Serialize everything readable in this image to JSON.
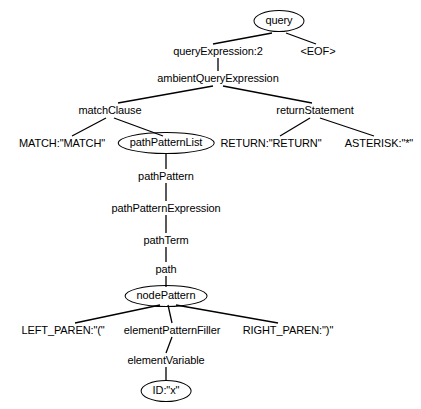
{
  "diagram": {
    "type": "parse-tree",
    "background_color": "#ffffff",
    "stroke_color": "#000000",
    "text_color": "#000000",
    "nodes": [
      {
        "id": "query",
        "label": "query",
        "shape": "ellipse",
        "x": 279,
        "y": 21,
        "depth": 0
      },
      {
        "id": "queryExpression",
        "label": "queryExpression:2",
        "shape": "plain",
        "x": 218,
        "y": 51,
        "depth": 1
      },
      {
        "id": "eof",
        "label": "<EOF>",
        "shape": "plain",
        "x": 318,
        "y": 51,
        "depth": 1
      },
      {
        "id": "ambientQueryExpression",
        "label": "ambientQueryExpression",
        "shape": "plain",
        "x": 218,
        "y": 78,
        "depth": 2
      },
      {
        "id": "matchClause",
        "label": "matchClause",
        "shape": "plain",
        "x": 110,
        "y": 110,
        "depth": 3
      },
      {
        "id": "returnStatement",
        "label": "returnStatement",
        "shape": "plain",
        "x": 315,
        "y": 110,
        "depth": 3
      },
      {
        "id": "matchToken",
        "label": "MATCH:\"MATCH\"",
        "shape": "plain",
        "x": 62,
        "y": 143,
        "depth": 4
      },
      {
        "id": "pathPatternList",
        "label": "pathPatternList",
        "shape": "ellipse",
        "x": 166,
        "y": 143,
        "depth": 4
      },
      {
        "id": "returnToken",
        "label": "RETURN:\"RETURN\"",
        "shape": "plain",
        "x": 271,
        "y": 143,
        "depth": 4
      },
      {
        "id": "asteriskToken",
        "label": "ASTERISK:\"*\"",
        "shape": "plain",
        "x": 379,
        "y": 143,
        "depth": 4
      },
      {
        "id": "pathPattern",
        "label": "pathPattern",
        "shape": "plain",
        "x": 166,
        "y": 176,
        "depth": 5
      },
      {
        "id": "pathPatternExpression",
        "label": "pathPatternExpression",
        "shape": "plain",
        "x": 166,
        "y": 208,
        "depth": 6
      },
      {
        "id": "pathTerm",
        "label": "pathTerm",
        "shape": "plain",
        "x": 166,
        "y": 240,
        "depth": 7
      },
      {
        "id": "path",
        "label": "path",
        "shape": "plain",
        "x": 166,
        "y": 269,
        "depth": 8
      },
      {
        "id": "nodePattern",
        "label": "nodePattern",
        "shape": "ellipse",
        "x": 166,
        "y": 296,
        "depth": 9
      },
      {
        "id": "leftParen",
        "label": "LEFT_PAREN:\"(\"",
        "shape": "plain",
        "x": 63,
        "y": 330,
        "depth": 10
      },
      {
        "id": "elementPatternFiller",
        "label": "elementPatternFiller",
        "shape": "plain",
        "x": 172,
        "y": 330,
        "depth": 10
      },
      {
        "id": "rightParen",
        "label": "RIGHT_PAREN:\")\"",
        "shape": "plain",
        "x": 288,
        "y": 330,
        "depth": 10
      },
      {
        "id": "elementVariable",
        "label": "elementVariable",
        "shape": "plain",
        "x": 166,
        "y": 360,
        "depth": 11
      },
      {
        "id": "idToken",
        "label": "ID:\"x\"",
        "shape": "ellipse",
        "x": 166,
        "y": 391,
        "depth": 12
      }
    ],
    "edges": [
      {
        "from": "query",
        "to": "queryExpression",
        "x1": 272,
        "y1": 33,
        "x2": 213,
        "y2": 44
      },
      {
        "from": "query",
        "to": "eof",
        "x1": 286,
        "y1": 33,
        "x2": 316,
        "y2": 44
      },
      {
        "from": "queryExpression",
        "to": "ambientQueryExpression",
        "x1": 218,
        "y1": 58,
        "x2": 218,
        "y2": 71
      },
      {
        "from": "ambientQueryExpression",
        "to": "matchClause",
        "x1": 213,
        "y1": 86,
        "x2": 118,
        "y2": 103
      },
      {
        "from": "ambientQueryExpression",
        "to": "returnStatement",
        "x1": 223,
        "y1": 86,
        "x2": 312,
        "y2": 103
      },
      {
        "from": "matchClause",
        "to": "matchToken",
        "x1": 106,
        "y1": 118,
        "x2": 72,
        "y2": 136
      },
      {
        "from": "matchClause",
        "to": "pathPatternList",
        "x1": 114,
        "y1": 118,
        "x2": 163,
        "y2": 136
      },
      {
        "from": "returnStatement",
        "to": "returnToken",
        "x1": 310,
        "y1": 118,
        "x2": 280,
        "y2": 136
      },
      {
        "from": "returnStatement",
        "to": "asteriskToken",
        "x1": 320,
        "y1": 118,
        "x2": 374,
        "y2": 136
      },
      {
        "from": "pathPatternList",
        "to": "pathPattern",
        "x1": 166,
        "y1": 154,
        "x2": 166,
        "y2": 169
      },
      {
        "from": "pathPattern",
        "to": "pathPatternExpression",
        "x1": 166,
        "y1": 183,
        "x2": 166,
        "y2": 201
      },
      {
        "from": "pathPatternExpression",
        "to": "pathTerm",
        "x1": 166,
        "y1": 215,
        "x2": 166,
        "y2": 233
      },
      {
        "from": "pathTerm",
        "to": "path",
        "x1": 166,
        "y1": 247,
        "x2": 166,
        "y2": 262
      },
      {
        "from": "path",
        "to": "nodePattern",
        "x1": 166,
        "y1": 276,
        "x2": 166,
        "y2": 287
      },
      {
        "from": "nodePattern",
        "to": "leftParen",
        "x1": 160,
        "y1": 305,
        "x2": 75,
        "y2": 323
      },
      {
        "from": "nodePattern",
        "to": "elementPatternFiller",
        "x1": 168,
        "y1": 305,
        "x2": 172,
        "y2": 323
      },
      {
        "from": "nodePattern",
        "to": "rightParen",
        "x1": 176,
        "y1": 305,
        "x2": 278,
        "y2": 323
      },
      {
        "from": "elementPatternFiller",
        "to": "elementVariable",
        "x1": 172,
        "y1": 337,
        "x2": 166,
        "y2": 353
      },
      {
        "from": "elementVariable",
        "to": "idToken",
        "x1": 166,
        "y1": 367,
        "x2": 166,
        "y2": 381
      }
    ]
  }
}
